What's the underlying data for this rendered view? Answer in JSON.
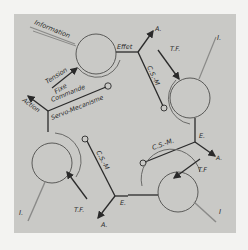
{
  "diagram": {
    "type": "servo-mechanism feedback loop",
    "colors": {
      "page_background": "#f3f3f1",
      "panel_background": "#c9c9c6",
      "line": "#2a2a2a",
      "input_line": "#8a8a88",
      "circle_stroke": "#5a5a58"
    },
    "units": [
      {
        "id": "unit-1",
        "labels": {
          "input": "Information",
          "tension": "Tension",
          "fixe": "Fixe",
          "effet": "Effet",
          "action_out": "A.",
          "link": "C.S.-M.",
          "commande": "Commande",
          "servo": "Servo-Mecanisme",
          "action": "Action"
        }
      },
      {
        "id": "unit-2",
        "labels": {
          "input": "I.",
          "tension_fixe": "T.F.",
          "effet": "E.",
          "action_out": "A.",
          "link": "C.S.-M"
        }
      },
      {
        "id": "unit-3",
        "labels": {
          "input": "I",
          "tension_fixe": "T.F",
          "effet": "E.",
          "action_out": "A."
        }
      },
      {
        "id": "unit-4",
        "labels": {
          "input": "I.",
          "tension_fixe": "T.F.",
          "link": "C.S.-M",
          "action_out": "A.",
          "effet": "E."
        }
      }
    ]
  }
}
